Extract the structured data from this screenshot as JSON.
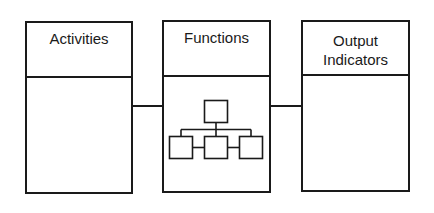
{
  "diagram": {
    "boxes": [
      {
        "id": "activities",
        "title": "Activities"
      },
      {
        "id": "functions",
        "title": "Functions",
        "icon": "hierarchy-org-chart-icon"
      },
      {
        "id": "output-indicators",
        "title_line1": "Output",
        "title_line2": "Indicators"
      }
    ],
    "connections": [
      {
        "from": "activities",
        "to": "functions"
      },
      {
        "from": "functions",
        "to": "output-indicators"
      }
    ],
    "colors": {
      "stroke": "#1a1a1a",
      "background": "#ffffff"
    }
  }
}
